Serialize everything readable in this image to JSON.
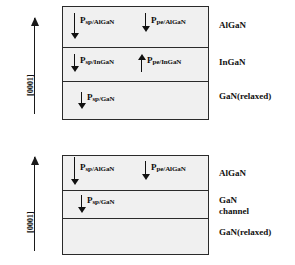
{
  "figure": {
    "direction_label": "[0001]",
    "colors": {
      "layer_fill": "#f0f0f0",
      "border": "#2a2a2a",
      "arrow": "#111111",
      "text": "#111111",
      "background": "#ffffff"
    }
  },
  "diagrams": [
    {
      "id": "algan-ingan-gan",
      "direction_label": "[0001]",
      "layers": [
        {
          "name": "AlGaN",
          "material_label": "AlGaN",
          "polarizations": [
            {
              "symbol": "P",
              "subscript": "sp/AlGaN",
              "direction": "down"
            },
            {
              "symbol": "P",
              "subscript": "pe/AlGaN",
              "direction": "down"
            }
          ]
        },
        {
          "name": "InGaN",
          "material_label": "InGaN",
          "polarizations": [
            {
              "symbol": "P",
              "subscript": "sp/InGaN",
              "direction": "down"
            },
            {
              "symbol": "P",
              "subscript": "pe/InGaN",
              "direction": "up"
            }
          ]
        },
        {
          "name": "GaN-relaxed",
          "material_label": "GaN(relaxed)",
          "polarizations": [
            {
              "symbol": "P",
              "subscript": "sp/GaN",
              "direction": "down"
            }
          ]
        }
      ]
    },
    {
      "id": "algan-gan-channel",
      "direction_label": "[0001]",
      "layers": [
        {
          "name": "AlGaN",
          "material_label": "AlGaN",
          "polarizations": [
            {
              "symbol": "P",
              "subscript": "sp/AlGaN",
              "direction": "down"
            },
            {
              "symbol": "P",
              "subscript": "pe/AlGaN",
              "direction": "down"
            }
          ]
        },
        {
          "name": "GaN-channel",
          "material_label": "GaN\nchannel",
          "material_label_line1": "GaN",
          "material_label_line2": "channel",
          "polarizations": [
            {
              "symbol": "P",
              "subscript": "sp/GaN",
              "direction": "down"
            }
          ]
        },
        {
          "name": "GaN-relaxed",
          "material_label": "GaN(relaxed)",
          "polarizations": []
        }
      ]
    }
  ]
}
